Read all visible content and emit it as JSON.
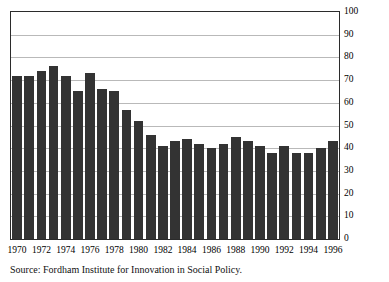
{
  "chart_data": {
    "type": "bar",
    "title": "",
    "subtitle": "",
    "xlabel": "",
    "ylabel": "",
    "ylim": [
      0,
      100
    ],
    "yticks": [
      0,
      10,
      20,
      30,
      40,
      50,
      60,
      70,
      80,
      90,
      100
    ],
    "grid": true,
    "legend": "none",
    "bar_color": "#333333",
    "gridline_color": "#b9b9b9",
    "frame_color": "#2b2b2b",
    "categories": [
      "1970",
      "1971",
      "1972",
      "1973",
      "1974",
      "1975",
      "1976",
      "1977",
      "1978",
      "1979",
      "1980",
      "1981",
      "1982",
      "1983",
      "1984",
      "1985",
      "1986",
      "1987",
      "1988",
      "1989",
      "1990",
      "1991",
      "1992",
      "1993",
      "1994",
      "1995",
      "1996"
    ],
    "values": [
      72,
      72,
      74,
      76,
      72,
      65,
      73,
      66,
      65,
      57,
      52,
      46,
      41,
      43,
      44,
      42,
      40,
      42,
      45,
      43,
      41,
      38,
      41,
      38,
      38,
      40,
      43
    ],
    "xtick_labels": [
      "1970",
      "1972",
      "1974",
      "1976",
      "1978",
      "1980",
      "1982",
      "1984",
      "1986",
      "1988",
      "1990",
      "1992",
      "1994",
      "1996"
    ],
    "xtick_categories": [
      "1970",
      "1972",
      "1974",
      "1976",
      "1978",
      "1980",
      "1982",
      "1984",
      "1986",
      "1988",
      "1990",
      "1992",
      "1994",
      "1996"
    ]
  },
  "source": {
    "text": "Source: Fordham Institute for Innovation in Social Policy."
  }
}
